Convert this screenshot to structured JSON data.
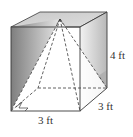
{
  "figure": {
    "labels": {
      "height": "4 ft",
      "depth": "3 ft",
      "width": "3 ft"
    },
    "colors": {
      "edge": "#3a3a3a",
      "top_face": "#d4d4d4",
      "shade_dark": "#8a8a8a",
      "shade_light": "#e8e8e8",
      "background": "#ffffff"
    }
  }
}
